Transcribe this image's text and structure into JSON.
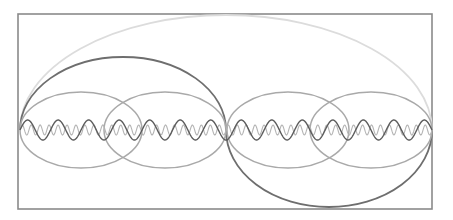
{
  "diagram": {
    "type": "harmonic-wave-diagram",
    "canvas": {
      "width": 453,
      "height": 220
    },
    "frame": {
      "x": 18,
      "y": 14,
      "width": 414,
      "height": 195,
      "stroke": "#8a8a8a",
      "stroke_width": 1.6
    },
    "baseline_y": 130,
    "x_start": 20,
    "x_end": 432,
    "curves": [
      {
        "id": "fundamental-arc",
        "kind": "arc-upper",
        "x0": 20,
        "x1": 432,
        "ry": 115,
        "stroke": "#dcdcdc",
        "width": 1.8
      },
      {
        "id": "second-harmonic-upper",
        "kind": "arc-upper",
        "x0": 20,
        "x1": 226,
        "ry": 73,
        "stroke": "#6e6e6e",
        "width": 1.8
      },
      {
        "id": "second-harmonic-lower",
        "kind": "arc-lower",
        "x0": 226,
        "x1": 432,
        "ry": 77,
        "stroke": "#6e6e6e",
        "width": 1.8
      },
      {
        "id": "ellipse-1",
        "kind": "ellipse",
        "cx": 81,
        "cy": 130,
        "rx": 61,
        "ry": 38,
        "stroke": "#a9a9a9",
        "width": 1.5
      },
      {
        "id": "ellipse-2",
        "kind": "ellipse",
        "cx": 165,
        "cy": 130,
        "rx": 61,
        "ry": 38,
        "stroke": "#a9a9a9",
        "width": 1.5
      },
      {
        "id": "ellipse-3",
        "kind": "ellipse",
        "cx": 288,
        "cy": 130,
        "rx": 61,
        "ry": 38,
        "stroke": "#a9a9a9",
        "width": 1.5
      },
      {
        "id": "ellipse-4",
        "kind": "ellipse",
        "cx": 371,
        "cy": 130,
        "rx": 61,
        "ry": 38,
        "stroke": "#a9a9a9",
        "width": 1.5
      }
    ],
    "waves": [
      {
        "id": "medium-wave",
        "amplitude": 10,
        "cycles": 13.5,
        "stroke": "#5c5c5c",
        "width": 1.4
      },
      {
        "id": "fine-wave",
        "amplitude": 5,
        "cycles": 46,
        "stroke": "#b4b4b4",
        "width": 1.1
      }
    ]
  }
}
